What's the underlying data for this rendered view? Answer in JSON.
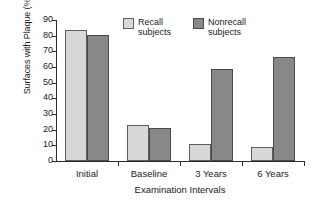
{
  "chart_data": {
    "type": "bar",
    "title": "",
    "xlabel": "Examination Intervals",
    "ylabel": "Surfaces with Plaque (%)",
    "categories": [
      "Initial",
      "Baseline",
      "3 Years",
      "6 Years"
    ],
    "series": [
      {
        "name": "Recall subjects",
        "color": "#d8d8d6",
        "values": [
          83.5,
          23,
          11,
          9
        ]
      },
      {
        "name": "Nonrecall subjects",
        "color": "#87888a",
        "values": [
          80.5,
          21,
          58.5,
          66.5
        ]
      }
    ],
    "ylim": [
      0,
      90
    ],
    "yticks": [
      0,
      10,
      20,
      30,
      40,
      50,
      60,
      70,
      80,
      90
    ],
    "ytick_labels": [
      "0",
      "10",
      "20",
      "30",
      "40",
      "50",
      "60",
      "70",
      "80",
      "90"
    ],
    "grid": false,
    "legend_position": "top-center",
    "legend": [
      {
        "label": "Recall\nsubjects",
        "swatch": "recall"
      },
      {
        "label": "Nonrecall\nsubjects",
        "swatch": "nonrecall"
      }
    ]
  }
}
